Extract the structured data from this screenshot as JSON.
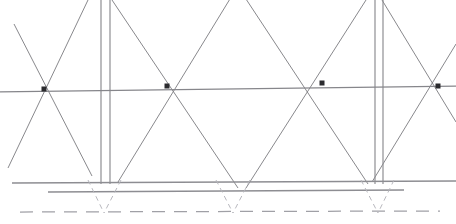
{
  "drawing": {
    "title": "Truss Lattice Elevation Line Drawing",
    "description": "Scanned monochrome technical line drawing of a zigzag lattice truss with four node markers, two double-post columns, a ground line pair and a dashed foundation datum line.",
    "canvas": {
      "width": 456,
      "height": 224
    },
    "background_color": "#ffffff",
    "colors": {
      "diagonal": "#7a7a7f",
      "column": "#8a8a8e",
      "ground": "#8d8d92",
      "dashed_datum": "#a0a0a6",
      "dashed_foundation": "#b4b4ba",
      "node": "#2b2b2e",
      "chord": "#86868b"
    },
    "chord": {
      "label": "upper-chord",
      "x1": 0,
      "y1": 92,
      "x2": 456,
      "y2": 86
    },
    "nodes": [
      {
        "label": "node-1",
        "x": 44,
        "y": 89,
        "size": 5
      },
      {
        "label": "node-2",
        "x": 167,
        "y": 86,
        "size": 5
      },
      {
        "label": "node-3",
        "x": 322,
        "y": 83,
        "size": 5
      },
      {
        "label": "node-4",
        "x": 438,
        "y": 86,
        "size": 5
      }
    ],
    "diagonals": [
      {
        "label": "diagonal-1",
        "x1": 14,
        "y1": 24,
        "x2": 92,
        "y2": 176
      },
      {
        "label": "diagonal-2",
        "x1": 88,
        "y1": 0,
        "x2": 8,
        "y2": 168
      },
      {
        "label": "diagonal-3",
        "x1": 118,
        "y1": 182,
        "x2": 233,
        "y2": -6
      },
      {
        "label": "diagonal-4",
        "x1": 112,
        "y1": 0,
        "x2": 238,
        "y2": 188
      },
      {
        "label": "diagonal-5",
        "x1": 244,
        "y1": -4,
        "x2": 368,
        "y2": 184
      },
      {
        "label": "diagonal-6",
        "x1": 246,
        "y1": 188,
        "x2": 366,
        "y2": 0
      },
      {
        "label": "diagonal-7",
        "x1": 372,
        "y1": 182,
        "x2": 456,
        "y2": 44
      },
      {
        "label": "diagonal-8",
        "x1": 382,
        "y1": 0,
        "x2": 456,
        "y2": 122
      }
    ],
    "columns": [
      {
        "label": "column-left",
        "x_left": 101,
        "x_right": 110,
        "y_top": 0,
        "y_bottom": 184
      },
      {
        "label": "column-right",
        "x_left": 375,
        "x_right": 383,
        "y_top": 0,
        "y_bottom": 184
      }
    ],
    "ground_lines": [
      {
        "label": "ground-line-upper",
        "x1": 12,
        "y1": 183,
        "x2": 456,
        "y2": 181
      },
      {
        "label": "ground-line-lower",
        "x1": 48,
        "y1": 192,
        "x2": 404,
        "y2": 190
      }
    ],
    "foundation_datum": {
      "label": "foundation-datum-dashed",
      "x1": 20,
      "y1": 212,
      "x2": 440,
      "y2": 211,
      "dash_pattern": "13 9"
    },
    "foundation_vees": [
      {
        "label": "foundation-vee-left",
        "apex_x": 104,
        "apex_y": 213,
        "top_left_x": 88,
        "top_right_x": 121,
        "top_y": 180
      },
      {
        "label": "foundation-vee-center",
        "apex_x": 233,
        "apex_y": 213,
        "top_left_x": 216,
        "top_right_x": 250,
        "top_y": 180
      },
      {
        "label": "foundation-vee-right",
        "apex_x": 378,
        "apex_y": 213,
        "top_left_x": 361,
        "top_right_x": 394,
        "top_y": 180
      }
    ]
  }
}
